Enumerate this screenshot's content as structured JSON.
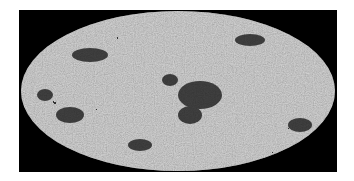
{
  "figure": {
    "projection": "mollweide",
    "background_color": "#000000",
    "map_base_color": "#a9a9a9",
    "feature_color": "#1a1a1a"
  }
}
